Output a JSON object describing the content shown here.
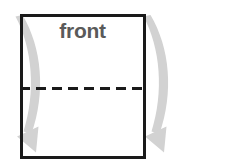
{
  "figure": {
    "title": "front",
    "type": "paper-folding-diagram",
    "background_color": "#ffffff"
  },
  "sheet": {
    "label": "front",
    "label_color": "#5a5a5a",
    "border_color": "#1a1a1a",
    "fill_color": "#ffffff",
    "border_width": 3,
    "x": 20,
    "y": 14,
    "width": 125,
    "height": 145
  },
  "fold_line": {
    "name": "horizontal-fold-crease",
    "style": "dashed",
    "color": "#1a1a1a",
    "y": 88,
    "x_start": 20,
    "x_end": 145,
    "dash_length": 10,
    "gap_length": 6,
    "width": 3
  },
  "arrows": [
    {
      "name": "left-fold-arrow",
      "color": "#d2d2d2",
      "direction": "down",
      "start_x": 24,
      "start_y": 16,
      "end_x": 28,
      "end_y": 148
    },
    {
      "name": "right-fold-arrow",
      "color": "#d2d2d2",
      "direction": "down",
      "start_x": 152,
      "start_y": 16,
      "end_x": 156,
      "end_y": 148
    }
  ]
}
